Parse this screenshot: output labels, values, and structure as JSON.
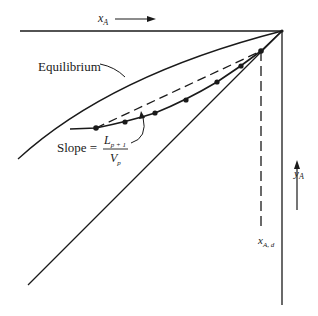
{
  "labels": {
    "x_axis": "x",
    "x_axis_sub": "A",
    "y_axis": "y",
    "y_axis_sub": "A",
    "equilibrium": "Equilibrium",
    "slope_prefix": "Slope =",
    "slope_num": "L",
    "slope_num_sub": "p + 1",
    "slope_den": "V",
    "slope_den_sub": "p",
    "xd": "x",
    "xd_sub": "A, d"
  },
  "colors": {
    "line": "#1a1a1a",
    "background": "#ffffff"
  },
  "geometry": {
    "corner": [
      282,
      31
    ],
    "stage_points": [
      [
        96,
        128
      ],
      [
        125,
        122
      ],
      [
        155,
        113
      ],
      [
        186,
        100
      ],
      [
        217,
        82
      ],
      [
        241,
        66
      ],
      [
        261,
        51
      ]
    ]
  }
}
